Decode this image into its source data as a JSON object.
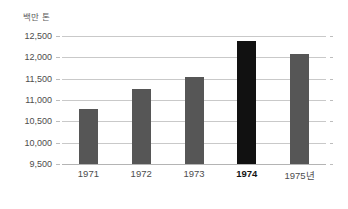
{
  "chart_data": {
    "type": "bar",
    "title": "",
    "subtitle": "",
    "ylabel": "백만 톤",
    "xlabel": "",
    "categories": [
      "1971",
      "1972",
      "1973",
      "1974",
      "1975년"
    ],
    "values": [
      10800,
      11250,
      11550,
      12380,
      12080
    ],
    "ylim": [
      9500,
      12500
    ],
    "y_ticks": [
      "12,500",
      "12,000",
      "11,500",
      "11,000",
      "10,500",
      "10,000",
      "9,500"
    ],
    "y_tick_values": [
      12500,
      12000,
      11500,
      11000,
      10500,
      10000,
      9500
    ],
    "grid": true,
    "legend": false,
    "legend_position": "none",
    "series": [
      {
        "name": "생산량",
        "values": [
          10800,
          11250,
          11550,
          12380,
          12080
        ]
      }
    ],
    "highlight_index": 3,
    "colors": {
      "bar": "#565656",
      "bar_highlight": "#111111",
      "gridline": "#c9c9c9",
      "baseline": "#b4b4b4",
      "tick_label": "#4d4d4d",
      "axis_title": "#5c5c5c",
      "background": "#ffffff"
    }
  }
}
